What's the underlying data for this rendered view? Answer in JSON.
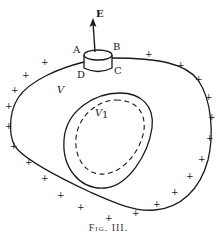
{
  "figure": {
    "caption": "Fig. III.",
    "labels": {
      "field": "E",
      "a": "A",
      "b": "B",
      "c": "C",
      "d": "D",
      "outer_volume": "V",
      "inner_volume": "V",
      "inner_subscript": "1"
    },
    "charge_symbol": "+",
    "charge_positions": [
      [
        148,
        54
      ],
      [
        180,
        65
      ],
      [
        198,
        79
      ],
      [
        208,
        97
      ],
      [
        211,
        117
      ],
      [
        209,
        138
      ],
      [
        201,
        159
      ],
      [
        189,
        176
      ],
      [
        174,
        192
      ],
      [
        156,
        204
      ],
      [
        135,
        213
      ],
      [
        108,
        218
      ],
      [
        80,
        207
      ],
      [
        60,
        195
      ],
      [
        44,
        178
      ],
      [
        28,
        162
      ],
      [
        13,
        146
      ],
      [
        8,
        126
      ],
      [
        8,
        106
      ],
      [
        14,
        90
      ],
      [
        25,
        75
      ],
      [
        44,
        62
      ]
    ],
    "colors": {
      "ink": "#1a1a1a",
      "background": "#ffffff"
    }
  }
}
